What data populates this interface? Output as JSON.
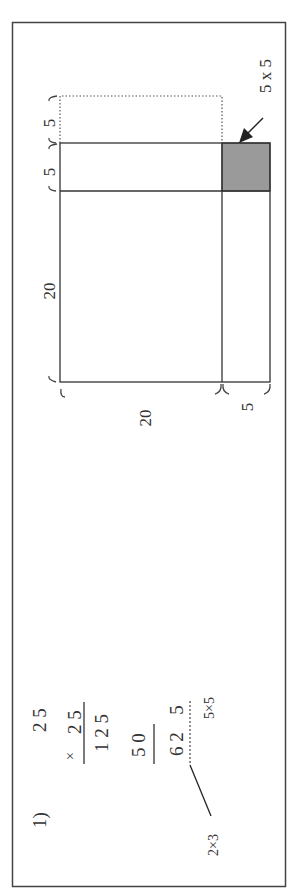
{
  "problem": {
    "number_label": "1)",
    "multiplicand": "2 5",
    "multiplier_sign": "×",
    "multiplier": "2 5",
    "partial_1": "1 2 5",
    "partial_2": "5 0",
    "product_head": "6 2",
    "product_tail": "5",
    "note_right": "5×5",
    "note_left": "2×3"
  },
  "area_model": {
    "side_big_vertical": "20",
    "side_small_vertical_1": "5",
    "side_small_vertical_2": "5",
    "side_big_horizontal": "20",
    "side_small_horizontal": "5",
    "callout_label": "5 x 5",
    "shade_color": "#9a9a9a",
    "line_color": "#333333"
  }
}
